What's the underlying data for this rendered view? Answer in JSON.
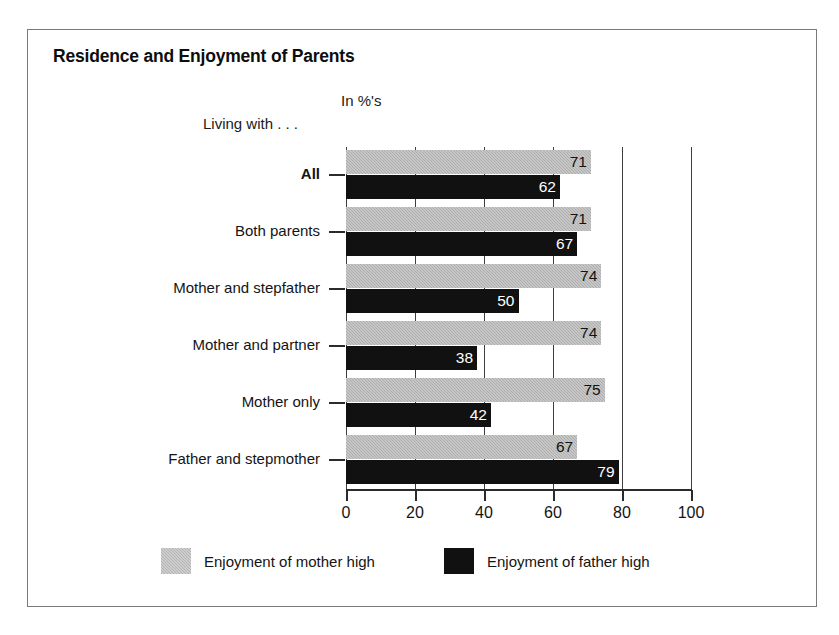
{
  "figure": {
    "title": "Residence and Enjoyment of Parents",
    "units_note": "In %'s",
    "group_axis_caption": "Living with . . ."
  },
  "chart_data": {
    "type": "bar",
    "orientation": "horizontal",
    "title": "Residence and Enjoyment of Parents",
    "xlabel": "",
    "ylabel": "Living with . . .",
    "units": "In %'s",
    "xlim": [
      0,
      100
    ],
    "xticks": [
      0,
      20,
      40,
      60,
      80,
      100
    ],
    "xticklabels": [
      "0",
      "20",
      "40",
      "60",
      "80",
      "100"
    ],
    "grid": true,
    "legend_position": "bottom",
    "categories": [
      "All",
      "Both parents",
      "Mother and stepfather",
      "Mother and partner",
      "Mother only",
      "Father and stepmother"
    ],
    "series": [
      {
        "name": "Enjoyment of mother high",
        "color": "#aeaeae",
        "values": [
          71,
          71,
          74,
          74,
          75,
          67
        ]
      },
      {
        "name": "Enjoyment of father high",
        "color": "#111111",
        "values": [
          62,
          67,
          50,
          38,
          42,
          79
        ]
      }
    ]
  },
  "colors": {
    "mother_bar": "#aeaeae",
    "father_bar": "#111111",
    "frame": "#7a7a7a",
    "axis": "#2b2b2b",
    "text": "#141414"
  }
}
